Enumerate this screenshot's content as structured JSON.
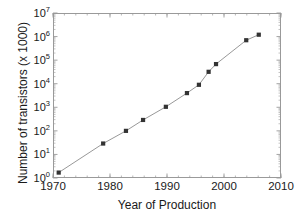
{
  "chart_data": {
    "type": "line",
    "title": "",
    "xlabel": "Year of Production",
    "ylabel": "Number of transistors (x 1000)",
    "xlim": [
      1970,
      2010
    ],
    "ylim": [
      1,
      10000000
    ],
    "yscale": "log",
    "xscale": "linear",
    "grid": false,
    "legend": null,
    "marker": "square",
    "marker_color": "#333333",
    "line_color": "#8c8c8c",
    "xticks": [
      1970,
      1980,
      1990,
      2000,
      2010
    ],
    "xtick_labels": [
      "1970",
      "1980",
      "1990",
      "2000",
      "2010"
    ],
    "xminor_step": 2,
    "yticks": [
      1,
      10,
      100,
      1000,
      10000,
      100000,
      1000000,
      10000000
    ],
    "ytick_labels": [
      "10⁰",
      "10¹",
      "10²",
      "10³",
      "10⁴",
      "10⁵",
      "10⁶",
      "10⁷"
    ],
    "ytick_mantissa": [
      "10",
      "10",
      "10",
      "10",
      "10",
      "10",
      "10",
      "10"
    ],
    "ytick_exponent": [
      "0",
      "1",
      "2",
      "3",
      "4",
      "5",
      "6",
      "7"
    ],
    "x": [
      1971,
      1978.8,
      1982.8,
      1985.8,
      1989.8,
      1993.5,
      1995.6,
      1997.3,
      1998.6,
      2003.9,
      2006.1
    ],
    "y": [
      1.7,
      29,
      100,
      290,
      1050,
      4000,
      9000,
      32000,
      68000,
      700000,
      1200000
    ],
    "points": [
      {
        "x": 1971,
        "y": 1.7
      },
      {
        "x": 1978.8,
        "y": 29
      },
      {
        "x": 1982.8,
        "y": 100
      },
      {
        "x": 1985.8,
        "y": 290
      },
      {
        "x": 1989.8,
        "y": 1050
      },
      {
        "x": 1993.5,
        "y": 4000
      },
      {
        "x": 1995.6,
        "y": 9000
      },
      {
        "x": 1997.3,
        "y": 32000
      },
      {
        "x": 1998.6,
        "y": 68000
      },
      {
        "x": 2003.9,
        "y": 700000
      },
      {
        "x": 2006.1,
        "y": 1200000
      }
    ]
  },
  "axes": {
    "x_title": "Year of Production",
    "y_title": "Number of transistors (x 1000)"
  },
  "colors": {
    "frame": "#9a9a9a",
    "line": "#8c8c8c",
    "marker": "#333333",
    "text": "#1a1a1a",
    "background": "#ffffff"
  }
}
